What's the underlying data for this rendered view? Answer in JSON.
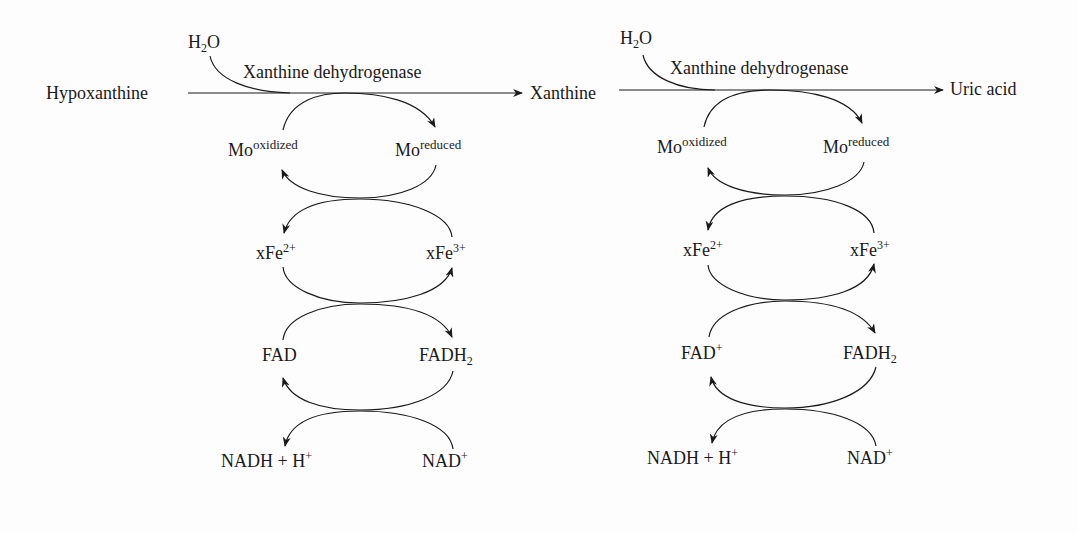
{
  "diagram": {
    "type": "metabolic-pathway",
    "substrates": [
      "Hypoxanthine",
      "Xanthine",
      "Uric acid"
    ],
    "steps": [
      {
        "from": "Hypoxanthine",
        "to": "Xanthine",
        "enzyme": "Xanthine dehydrogenase",
        "cosubstrate": {
          "base": "H",
          "sub": "2",
          "tail": "O"
        },
        "mo_oxidized": {
          "base": "Mo",
          "sup": "oxidized"
        },
        "mo_reduced": {
          "base": "Mo",
          "sup": "reduced"
        },
        "fe_reduced": {
          "base": "xFe",
          "sup": "2+"
        },
        "fe_oxidized": {
          "base": "xFe",
          "sup": "3+"
        },
        "fad_ox": {
          "base": "FAD",
          "sup": ""
        },
        "fad_red": {
          "base": "FADH",
          "sub": "2"
        },
        "nadh": {
          "base": "NADH + H",
          "sup": "+"
        },
        "nad": {
          "base": "NAD",
          "sup": "+"
        }
      },
      {
        "from": "Xanthine",
        "to": "Uric acid",
        "enzyme": "Xanthine dehydrogenase",
        "cosubstrate": {
          "base": "H",
          "sub": "2",
          "tail": "O"
        },
        "mo_oxidized": {
          "base": "Mo",
          "sup": "oxidized"
        },
        "mo_reduced": {
          "base": "Mo",
          "sup": "reduced"
        },
        "fe_reduced": {
          "base": "xFe",
          "sup": "2+"
        },
        "fe_oxidized": {
          "base": "xFe",
          "sup": "3+"
        },
        "fad_ox": {
          "base": "FAD",
          "sup": "+"
        },
        "fad_red": {
          "base": "FADH",
          "sub": "2"
        },
        "nadh": {
          "base": "NADH + H",
          "sup": "+"
        },
        "nad": {
          "base": "NAD",
          "sup": "+"
        }
      }
    ]
  }
}
